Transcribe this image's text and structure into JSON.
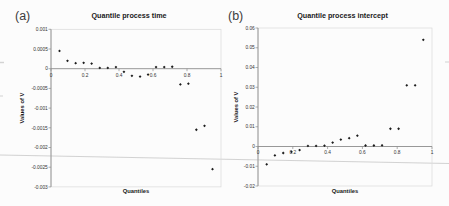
{
  "colors": {
    "background": "#fcfcfc",
    "marker": "#1c1c1c",
    "axis_line": "#8c8c8c",
    "plot_frame": "#d9d9d9",
    "tick_text": "#333333",
    "title_text": "#1a1a1a",
    "panel_label_text": "#3d3d3d",
    "artifact_line": "#c8c8c8"
  },
  "chart_data": [
    {
      "type": "scatter",
      "panel_label": "(a)",
      "title": "Quantile process time",
      "xlabel": "Quantiles",
      "ylabel": "Values of V",
      "xlim": [
        0,
        1
      ],
      "ylim": [
        -0.003,
        0.001
      ],
      "grid": false,
      "legend": null,
      "marker": "diamond",
      "x_tick_labels": [
        "0",
        "0.2",
        "0.4",
        "0.6",
        "0.8",
        "1"
      ],
      "x_tick_values": [
        0,
        0.2,
        0.4,
        0.6,
        0.8,
        1
      ],
      "y_tick_labels": [
        "0.001",
        "0.0005",
        "0",
        "-0.0005",
        "-0.001",
        "-0.0015",
        "-0.002",
        "-0.0025",
        "-0.003"
      ],
      "y_tick_values": [
        0.001,
        0.0005,
        0,
        -0.0005,
        -0.001,
        -0.0015,
        -0.002,
        -0.0025,
        -0.003
      ],
      "x": [
        0.05,
        0.097,
        0.145,
        0.192,
        0.239,
        0.287,
        0.334,
        0.382,
        0.429,
        0.476,
        0.524,
        0.571,
        0.618,
        0.666,
        0.713,
        0.761,
        0.808,
        0.855,
        0.903,
        0.95
      ],
      "y": [
        0.00045,
        0.0002,
        0.00014,
        0.00015,
        0.00013,
        2e-05,
        2e-05,
        4e-05,
        -8e-05,
        -0.00018,
        -0.0002,
        -0.00015,
        4e-05,
        4e-05,
        5e-05,
        -0.0004,
        -0.00038,
        -0.00155,
        -0.00145,
        -0.00255
      ]
    },
    {
      "type": "scatter",
      "panel_label": "(b)",
      "title": "Quantile process intercept",
      "xlabel": "Quantiles",
      "ylabel": "Values of V",
      "xlim": [
        0,
        1
      ],
      "ylim": [
        -0.02,
        0.06
      ],
      "grid": false,
      "legend": null,
      "marker": "diamond",
      "x_tick_labels": [
        "0",
        "0.2",
        "0.4",
        "0.6",
        "0.8",
        "1"
      ],
      "x_tick_values": [
        0,
        0.2,
        0.4,
        0.6,
        0.8,
        1
      ],
      "y_tick_labels": [
        "0.06",
        "0.05",
        "0.04",
        "0.03",
        "0.02",
        "0.01",
        "0",
        "-0.01",
        "-0.02"
      ],
      "y_tick_values": [
        0.06,
        0.05,
        0.04,
        0.03,
        0.02,
        0.01,
        0,
        -0.01,
        -0.02
      ],
      "x": [
        0.05,
        0.097,
        0.145,
        0.192,
        0.239,
        0.287,
        0.334,
        0.382,
        0.429,
        0.476,
        0.524,
        0.571,
        0.618,
        0.666,
        0.713,
        0.761,
        0.808,
        0.855,
        0.903,
        0.95
      ],
      "y": [
        -0.009,
        -0.0045,
        -0.0033,
        -0.0027,
        -0.0018,
        0.0003,
        0.0003,
        0.0004,
        0.002,
        0.0035,
        0.0042,
        0.0055,
        0.0005,
        0.0005,
        0.0006,
        0.009,
        0.009,
        0.031,
        0.031,
        0.054
      ]
    }
  ]
}
